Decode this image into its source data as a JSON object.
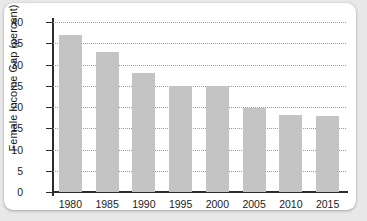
{
  "chart_data": {
    "type": "bar",
    "title": "",
    "xlabel": "",
    "ylabel": "Female Income Gap (percent)",
    "categories": [
      "1980",
      "1985",
      "1990",
      "1995",
      "2000",
      "2005",
      "2010",
      "2015"
    ],
    "values": [
      37,
      33,
      28,
      25,
      25,
      19.7,
      18.2,
      17.8
    ],
    "ylim": [
      0,
      40
    ],
    "ytick_labels": [
      "0",
      "5",
      "10",
      "15",
      "20",
      "25",
      "30",
      "35",
      "40"
    ],
    "ytick_values": [
      0,
      5,
      10,
      15,
      20,
      25,
      30,
      35,
      40
    ],
    "grid": "horizontal-dotted",
    "legend": "none",
    "bar_color": "#c4c4c4",
    "axis_color": "#2b2b2b",
    "grid_color": "#9a9a9a",
    "background_color": "#ffffff",
    "page_background_color": "#e8e8e8"
  }
}
